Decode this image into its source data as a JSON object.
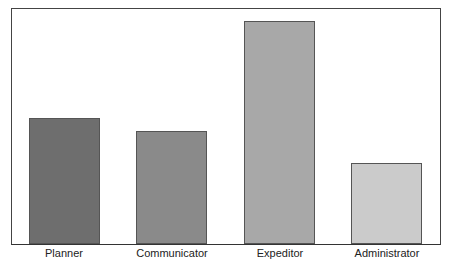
{
  "chart_data": {
    "type": "bar",
    "title": "",
    "xlabel": "",
    "ylabel": "",
    "categories": [
      "Planner",
      "Communicator",
      "Expeditor",
      "Administrator"
    ],
    "values": [
      126,
      113,
      223,
      81
    ],
    "value_units": "relative bar height (px); no y-axis shown",
    "ylim": [
      0,
      236
    ],
    "grid": false,
    "legend": null,
    "colors": [
      "#6e6e6e",
      "#8a8a8a",
      "#a8a8a8",
      "#cbcbcb"
    ]
  }
}
